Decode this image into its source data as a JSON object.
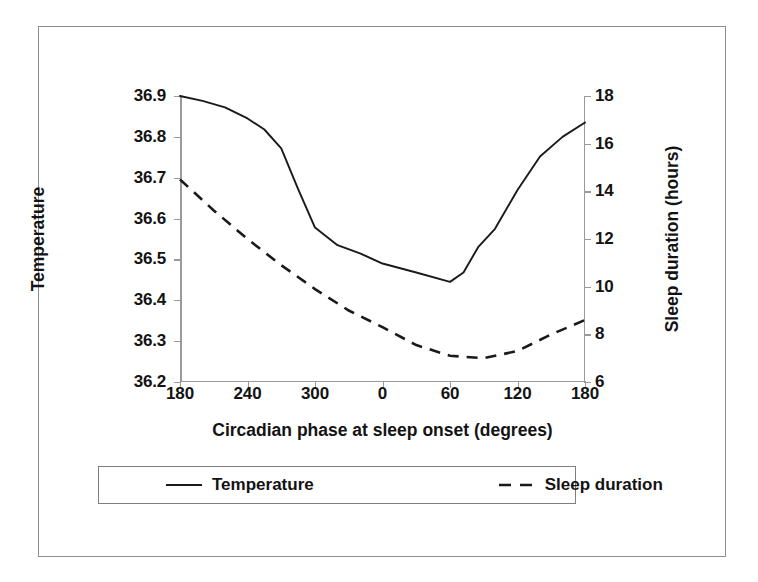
{
  "figure": {
    "background_color": "#ffffff",
    "frame_color": "#8d8d8d",
    "axis_color": "#9a9a9a",
    "line_color": "#1a1a1a"
  },
  "chart_data": {
    "type": "line",
    "title": "",
    "xlabel": "Circadian phase at sleep onset (degrees)",
    "ylabel": "Temperature",
    "y2label": "Sleep duration (hours)",
    "grid": false,
    "legend_position": "below-plot",
    "x_tick_labels": [
      "180",
      "240",
      "300",
      "0",
      "60",
      "120",
      "180"
    ],
    "x_tick_values": [
      180,
      240,
      300,
      360,
      420,
      480,
      540
    ],
    "xlim": [
      180,
      540
    ],
    "y_tick_labels": [
      "36.2",
      "36.3",
      "36.4",
      "36.5",
      "36.6",
      "36.7",
      "36.8",
      "36.9"
    ],
    "y_tick_values": [
      36.2,
      36.3,
      36.4,
      36.5,
      36.6,
      36.7,
      36.8,
      36.9
    ],
    "ylim": [
      36.2,
      36.9
    ],
    "y2_tick_labels": [
      "6",
      "8",
      "10",
      "12",
      "14",
      "16",
      "18"
    ],
    "y2_tick_values": [
      6,
      8,
      10,
      12,
      14,
      16,
      18
    ],
    "y2lim": [
      6,
      18
    ],
    "series": [
      {
        "name": "Temperature",
        "axis": "left",
        "style": "solid",
        "x": [
          180,
          200,
          220,
          240,
          255,
          270,
          285,
          300,
          320,
          340,
          360,
          390,
          420,
          432,
          445,
          460,
          480,
          500,
          520,
          540
        ],
        "values": [
          36.9,
          36.888,
          36.872,
          36.845,
          36.818,
          36.772,
          36.672,
          36.578,
          36.535,
          36.515,
          36.49,
          36.468,
          36.445,
          36.468,
          36.53,
          36.575,
          36.67,
          36.752,
          36.8,
          36.835
        ]
      },
      {
        "name": "Sleep duration",
        "axis": "right",
        "style": "dashed",
        "x": [
          180,
          210,
          240,
          270,
          300,
          330,
          360,
          390,
          420,
          450,
          480,
          510,
          540
        ],
        "values": [
          14.5,
          13.2,
          12.0,
          10.9,
          9.9,
          9.0,
          8.3,
          7.55,
          7.1,
          7.0,
          7.3,
          8.0,
          8.6
        ]
      }
    ],
    "series_detailed_px_note": ""
  },
  "legend": {
    "entries": [
      {
        "label": "Temperature",
        "style": "solid"
      },
      {
        "label": "Sleep duration",
        "style": "dashed"
      }
    ]
  }
}
